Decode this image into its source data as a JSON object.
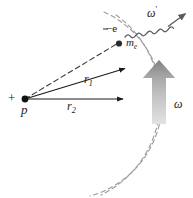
{
  "figure": {
    "name": "bremsstrahlung-radiation-diagram",
    "background_color": "#ffffff",
    "width": 193,
    "height": 198
  },
  "labels": {
    "proton": "p",
    "proton_charge": "+",
    "radius_inner": "r",
    "radius_inner_sub": "1",
    "radius_outer": "r",
    "radius_outer_sub": "2",
    "electron_charge": "−e",
    "electron_mass": "m",
    "electron_mass_sub": "e",
    "angular_velocity": "ω",
    "photon_frequency": "ω",
    "photon_frequency_prime": "′"
  },
  "colors": {
    "line": "#1a1a1a",
    "dashed_line": "#333333",
    "arc": "#9a9a9a",
    "omega_arrow_dark": "#707070",
    "omega_arrow_light": "#d8d8d8",
    "photon_wave": "#555555",
    "text": "#1a1a1a",
    "background": "#ffffff"
  },
  "geometry": {
    "proton_point": [
      25,
      99
    ],
    "electron_point": [
      118,
      44
    ],
    "r1_arrow_tip": [
      128,
      68
    ],
    "r2_arrow_tip": [
      126,
      99
    ],
    "arc_center": [
      25,
      99
    ],
    "arc_radius_inner": 98,
    "arc_radius_outer": 105,
    "omega_arrow_base": [
      158,
      123
    ],
    "omega_arrow_tip": [
      158,
      63
    ],
    "photon_start": [
      128,
      36
    ],
    "photon_end": [
      184,
      12
    ]
  },
  "elements": {
    "arcs_count": 2,
    "arc_style": "dashed",
    "omega_arrow_style": "thick-gradient-up",
    "photon_style": "sinusoidal-wavy-arrow"
  }
}
